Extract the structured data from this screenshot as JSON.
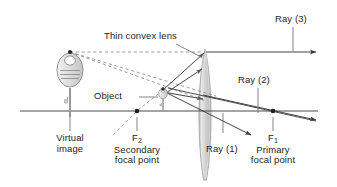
{
  "figure": {
    "width": 337,
    "height": 187,
    "background": "#ffffff"
  },
  "colors": {
    "ink": "#242424",
    "line": "#3a3a3a",
    "dashed": "#8d8d8d",
    "axis": "#4a4a4a",
    "lens_fill": "#d8d8d8",
    "lens_edge": "#9a9a9a",
    "key_fill": "#e2e2e2",
    "key_edge": "#8a8a8a",
    "leader": "#6f6f6f"
  },
  "labels": {
    "thin_convex_lens": "Thin convex lens",
    "ray_3": "Ray (3)",
    "ray_2": "Ray (2)",
    "ray_1": "Ray (1)",
    "object": "Object",
    "virtual_image_line1": "Virtual",
    "virtual_image_line2": "image",
    "f2_symbol": "F",
    "f2_subscript": "2",
    "f2_line1": "Secondary",
    "f2_line2": "focal point",
    "f1_symbol": "F",
    "f1_subscript": "1",
    "f1_line1": "Primary",
    "f1_line2": "focal point"
  },
  "geometry": {
    "optical_axis": {
      "x1": 20,
      "y1": 111,
      "x2": 318,
      "y2": 111
    },
    "lens": {
      "center_x": 205,
      "top_y": 49,
      "bottom_y": 180,
      "half_width": 7.5
    },
    "focal_points": [
      {
        "name": "F2",
        "x": 137,
        "y": 111,
        "side": "left"
      },
      {
        "name": "F1",
        "x": 273,
        "y": 111,
        "side": "right"
      }
    ],
    "object": {
      "tip_x": 163,
      "tip_y": 90,
      "base_x": 163,
      "base_y": 111
    },
    "virtual_image": {
      "tip_x": 70,
      "tip_y": 52,
      "base_x": 70,
      "base_y": 111
    }
  },
  "rays": [
    {
      "id": "ray-1",
      "label": "Ray (1)",
      "description": "through optical centre, undeviated",
      "points": [
        [
          163,
          90
        ],
        [
          205,
          111
        ],
        [
          252,
          134
        ]
      ]
    },
    {
      "id": "ray-2",
      "label": "Ray (2)",
      "description": "toward primary focal point, emerges parallel-shifted",
      "points": [
        [
          163,
          90
        ],
        [
          205,
          101
        ],
        [
          318,
          118
        ]
      ]
    },
    {
      "id": "ray-3",
      "label": "Ray (3)",
      "description": "parallel to axis, refracted through secondary focal point",
      "points": [
        [
          163,
          90
        ],
        [
          205,
          52
        ],
        [
          318,
          52
        ]
      ]
    },
    {
      "id": "ray-aux",
      "description": "upward ray striking lens above axis",
      "points": [
        [
          163,
          94
        ],
        [
          205,
          67
        ]
      ]
    },
    {
      "id": "ray-lower",
      "description": "ray crossing the axis beyond the lens",
      "points": [
        [
          205,
          95
        ],
        [
          318,
          120
        ]
      ]
    }
  ],
  "construction_lines": [
    {
      "id": "dashed-top",
      "description": "virtual image tip to lens top intercept",
      "points": [
        [
          70,
          52
        ],
        [
          205,
          52
        ]
      ]
    },
    {
      "id": "dashed-mid",
      "description": "virtual image tip to mid lens intercept",
      "points": [
        [
          70,
          52
        ],
        [
          215,
          96
        ]
      ]
    },
    {
      "id": "dashed-low",
      "description": "virtual image tip to object region",
      "points": [
        [
          70,
          52
        ],
        [
          205,
          101
        ]
      ]
    },
    {
      "id": "dashed-f2",
      "description": "incident ray direction through secondary focal point",
      "points": [
        [
          163,
          90
        ],
        [
          137,
          111
        ],
        [
          112,
          135
        ]
      ]
    }
  ],
  "leaders": [
    {
      "id": "leader-lens",
      "points": [
        [
          175,
          44
        ],
        [
          200,
          57
        ]
      ]
    },
    {
      "id": "leader-ray3",
      "points": [
        [
          293,
          26
        ],
        [
          293,
          51
        ]
      ]
    },
    {
      "id": "leader-ray2",
      "points": [
        [
          258,
          87
        ],
        [
          258,
          112
        ]
      ]
    },
    {
      "id": "leader-ray1",
      "points": [
        [
          223,
          128
        ],
        [
          237,
          127
        ]
      ]
    },
    {
      "id": "leader-object",
      "points": [
        [
          139,
          97
        ],
        [
          160,
          97
        ]
      ]
    },
    {
      "id": "leader-virtual",
      "points": [
        [
          70,
          118
        ],
        [
          70,
          131
        ]
      ]
    },
    {
      "id": "leader-f2",
      "points": [
        [
          137,
          118
        ],
        [
          137,
          131
        ]
      ]
    },
    {
      "id": "leader-f1",
      "points": [
        [
          273,
          118
        ],
        [
          273,
          131
        ]
      ]
    }
  ]
}
